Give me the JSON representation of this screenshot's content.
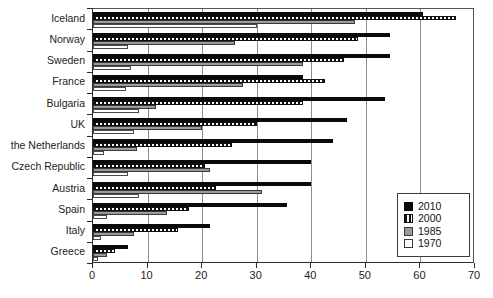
{
  "chart_data": {
    "type": "bar",
    "orientation": "horizontal",
    "title": "",
    "subtitle": "",
    "xlabel": "",
    "ylabel": "",
    "xlim": [
      0,
      70
    ],
    "xticks": [
      0,
      10,
      20,
      30,
      40,
      50,
      60,
      70
    ],
    "grid": true,
    "grid_axis": "x",
    "legend_position": "bottom-right",
    "categories": [
      "Iceland",
      "Norway",
      "Sweden",
      "France",
      "Bulgaria",
      "UK",
      "the Netherlands",
      "Czech Republic",
      "Austria",
      "Spain",
      "Italy",
      "Greece"
    ],
    "series": [
      {
        "name": "2010",
        "color": "#0a0a0a",
        "pattern": "solid",
        "values": [
          60.5,
          54.5,
          54.5,
          38.5,
          53.5,
          46.5,
          44,
          40,
          40,
          35.5,
          21.5,
          6.5
        ]
      },
      {
        "name": "2000",
        "color": "#101010",
        "pattern": "hatched",
        "values": [
          66.5,
          48.5,
          46,
          42.5,
          38.5,
          30,
          25.5,
          20.5,
          22.5,
          17.5,
          15.5,
          4
        ]
      },
      {
        "name": "1985",
        "color": "#9a9a9a",
        "pattern": "gray",
        "values": [
          48,
          26,
          38.5,
          27.5,
          11.5,
          20,
          8,
          21.5,
          31,
          13.5,
          7.5,
          2.5
        ]
      },
      {
        "name": "1970",
        "color": "#ffffff",
        "pattern": "white",
        "values": [
          30,
          6.5,
          7,
          6,
          8.5,
          7.5,
          2,
          6.5,
          8.5,
          2.5,
          1.5,
          1
        ]
      }
    ]
  },
  "legend": {
    "items": [
      {
        "label": "2010",
        "key": "y2010"
      },
      {
        "label": "2000",
        "key": "y2000"
      },
      {
        "label": "1985",
        "key": "y1985"
      },
      {
        "label": "1970",
        "key": "y1970"
      }
    ]
  },
  "colors": {
    "axis": "#2b2b2b",
    "grid": "#8d8d8d",
    "background": "#ffffff",
    "series_2010": "#0a0a0a",
    "series_2000": "#101010",
    "series_1985": "#9a9a9a",
    "series_1970": "#ffffff"
  }
}
